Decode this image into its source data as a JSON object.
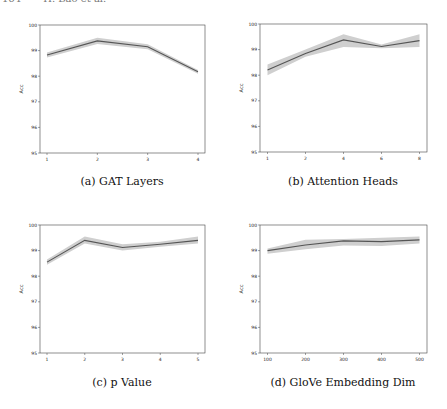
{
  "page_header": {
    "page_number": "164",
    "authors": "H. Bao et al."
  },
  "line_color": "#555555",
  "band_color": "#cfcfcf",
  "chart_data": [
    {
      "id": "a",
      "type": "line",
      "title": "",
      "caption": "(a) GAT Layers",
      "xlabel": "",
      "ylabel": "Acc",
      "categories": [
        "1",
        "2",
        "3",
        "4"
      ],
      "series": [
        {
          "name": "mean",
          "values": [
            98.83,
            99.38,
            99.15,
            98.17
          ]
        },
        {
          "name": "upper",
          "values": [
            98.93,
            99.5,
            99.25,
            98.24
          ]
        },
        {
          "name": "lower",
          "values": [
            98.73,
            99.26,
            99.05,
            98.1
          ]
        }
      ],
      "ylim": [
        95,
        100
      ],
      "yticks": [
        "95",
        "96",
        "97",
        "98",
        "99",
        "100"
      ],
      "grid": false,
      "legend": "none"
    },
    {
      "id": "b",
      "type": "line",
      "title": "",
      "caption": "(b) Attention Heads",
      "xlabel": "",
      "ylabel": "Acc",
      "categories": [
        "1",
        "2",
        "4",
        "6",
        "8"
      ],
      "series": [
        {
          "name": "mean",
          "values": [
            98.2,
            98.85,
            99.38,
            99.12,
            99.35
          ]
        },
        {
          "name": "upper",
          "values": [
            98.42,
            99.0,
            99.6,
            99.2,
            99.6
          ]
        },
        {
          "name": "lower",
          "values": [
            98.0,
            98.72,
            99.1,
            99.05,
            99.1
          ]
        }
      ],
      "ylim": [
        95,
        100
      ],
      "yticks": [
        "95",
        "96",
        "97",
        "98",
        "99",
        "100"
      ],
      "grid": false,
      "legend": "none"
    },
    {
      "id": "c",
      "type": "line",
      "title": "",
      "caption": "(c) p Value",
      "xlabel": "",
      "ylabel": "Acc",
      "categories": [
        "1",
        "2",
        "3",
        "4",
        "5"
      ],
      "series": [
        {
          "name": "mean",
          "values": [
            98.55,
            99.4,
            99.12,
            99.25,
            99.4
          ]
        },
        {
          "name": "upper",
          "values": [
            98.65,
            99.55,
            99.25,
            99.35,
            99.55
          ]
        },
        {
          "name": "lower",
          "values": [
            98.45,
            99.28,
            99.0,
            99.15,
            99.28
          ]
        }
      ],
      "ylim": [
        95,
        100
      ],
      "yticks": [
        "95",
        "96",
        "97",
        "98",
        "99",
        "100"
      ],
      "grid": false,
      "legend": "none"
    },
    {
      "id": "d",
      "type": "line",
      "title": "",
      "caption": "(d) GloVe Embedding Dim",
      "xlabel": "",
      "ylabel": "Acc",
      "categories": [
        "100",
        "200",
        "300",
        "400",
        "500"
      ],
      "series": [
        {
          "name": "mean",
          "values": [
            99.0,
            99.22,
            99.38,
            99.35,
            99.42
          ]
        },
        {
          "name": "upper",
          "values": [
            99.08,
            99.42,
            99.45,
            99.5,
            99.55
          ]
        },
        {
          "name": "lower",
          "values": [
            98.88,
            99.05,
            99.2,
            99.18,
            99.28
          ]
        }
      ],
      "ylim": [
        95,
        100
      ],
      "yticks": [
        "95",
        "96",
        "97",
        "98",
        "99",
        "100"
      ],
      "grid": false,
      "legend": "none"
    }
  ]
}
